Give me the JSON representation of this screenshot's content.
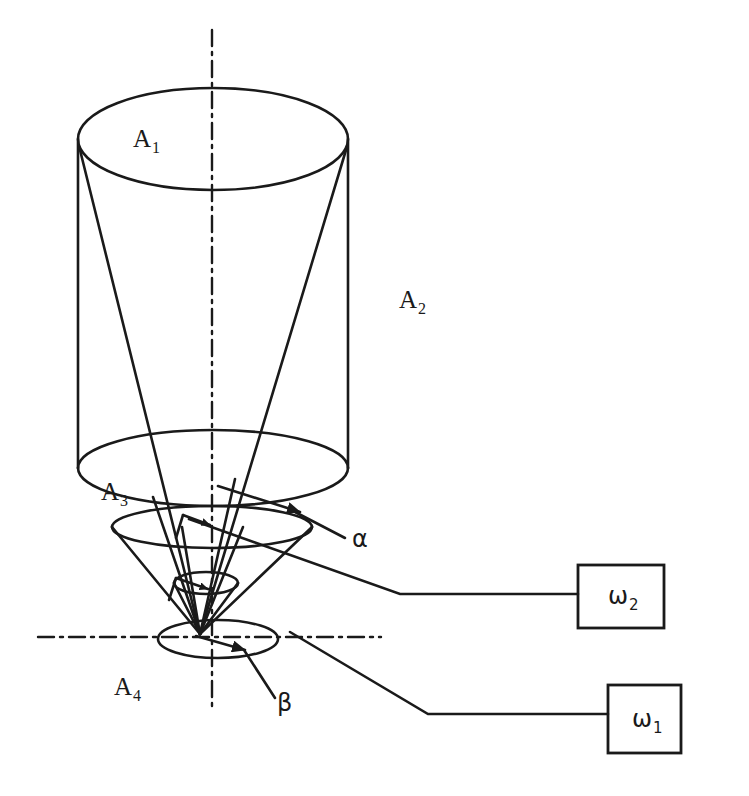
{
  "figure": {
    "background_color": "#ffffff",
    "stroke_color": "#1a1a1a",
    "width": 749,
    "height": 796
  },
  "labels": {
    "a1": {
      "base": "A",
      "sub": "1",
      "x": 133,
      "y": 147
    },
    "a2": {
      "base": "A",
      "sub": "2",
      "x": 399,
      "y": 308
    },
    "a3": {
      "base": "A",
      "sub": "3",
      "x": 101,
      "y": 500
    },
    "a4": {
      "base": "A",
      "sub": "4",
      "x": 114,
      "y": 695
    },
    "alpha": {
      "text": "α",
      "x": 352,
      "y": 547
    },
    "beta": {
      "text": "β",
      "x": 277,
      "y": 711
    }
  },
  "boxes": [
    {
      "name": "omega-2",
      "base": "ω",
      "sub": "2",
      "x": 578,
      "y": 565,
      "width": 86,
      "height": 63,
      "label_x": 608,
      "label_y": 604
    },
    {
      "name": "omega-1",
      "base": "ω",
      "sub": "1",
      "x": 608,
      "y": 685,
      "width": 73,
      "height": 68,
      "label_x": 632,
      "label_y": 727
    }
  ],
  "axes": {
    "vertical": {
      "x": 212,
      "y_top": 30,
      "y_bottom": 706
    },
    "horizontal": {
      "y": 637,
      "x_left": 38,
      "x_right": 381
    },
    "style": "dash-dot"
  },
  "cylinder": {
    "top_ellipse": {
      "cx": 213,
      "cy": 139,
      "rx": 135,
      "ry": 51
    },
    "bottom_ellipse": {
      "cx": 213,
      "cy": 468,
      "rx": 135,
      "ry": 38
    },
    "left_side_x": 78,
    "right_side_x": 348
  },
  "cone": {
    "apex": {
      "x": 200,
      "y": 634
    },
    "a3_ellipse": {
      "cx": 212,
      "cy": 527,
      "rx": 100,
      "ry": 21
    },
    "inner_ellipse": {
      "cx": 206,
      "cy": 583,
      "rx": 32,
      "ry": 11
    },
    "a4_ellipse": {
      "cx": 218,
      "cy": 639,
      "rx": 60,
      "ry": 19
    }
  },
  "leader_lines": {
    "omega2": "from bottom ellipse rim diagonally down-right then horizontal to omega-2 box",
    "omega1": "from apex diagonally down-right then horizontal to omega-1 box"
  }
}
